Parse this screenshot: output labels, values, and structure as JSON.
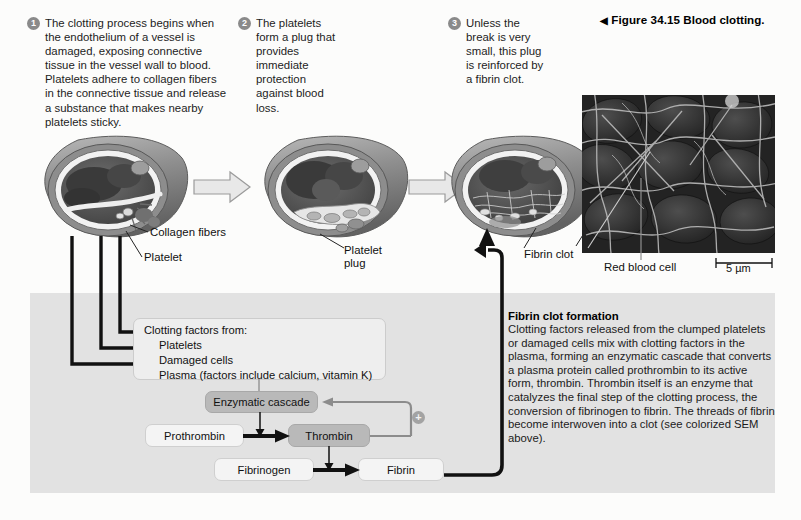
{
  "figure": {
    "caption_marker": "◀",
    "caption_number": "Figure 34.15",
    "caption_title": "Blood clotting."
  },
  "steps": [
    {
      "number": "1",
      "text": "The clotting process begins when the endothelium of a vessel is damaged, exposing connective tissue in the vessel wall to blood. Platelets adhere to collagen fibers in the connective tissue and release a substance that makes nearby platelets sticky."
    },
    {
      "number": "2",
      "text": "The platelets form a plug that provides immediate protection against blood loss."
    },
    {
      "number": "3",
      "text": "Unless the break is very small, this plug is reinforced by a fibrin clot."
    }
  ],
  "vessel_labels": {
    "collagen_fibers": "Collagen fibers",
    "platelet": "Platelet",
    "platelet_plug_line1": "Platelet",
    "platelet_plug_line2": "plug",
    "fibrin_clot": "Fibrin clot"
  },
  "micrograph": {
    "red_blood_cell_label": "Red blood cell",
    "scale_bar_label": "5 µm"
  },
  "clotting_factors": {
    "title": "Clotting factors from:",
    "items": [
      "Platelets",
      "Damaged cells",
      "Plasma (factors include calcium, vitamin K)"
    ]
  },
  "flowchart": {
    "enzymatic_cascade": "Enzymatic cascade",
    "prothrombin": "Prothrombin",
    "thrombin": "Thrombin",
    "fibrinogen": "Fibrinogen",
    "fibrin": "Fibrin",
    "feedback_symbol": "+"
  },
  "explanation": {
    "title": "Fibrin clot formation",
    "body": "Clotting factors released from the clumped platelets or damaged cells mix with clotting factors in the plasma, forming an enzymatic cascade that converts a plasma protein called prothrombin to its active form, thrombin. Thrombin itself is an enzyme that catalyzes the final step of the clotting process, the conversion of fibrinogen to fibrin. The threads of fibrin become interwoven into a clot (see colorized SEM above)."
  },
  "colors": {
    "panel_gray": "#e2e2e2",
    "box_dark": "#b9b9b9",
    "box_light": "#f4f4f4",
    "badge_gray": "#8a8a8a",
    "vessel_wall": "#9a9a9a",
    "vessel_interior": "#545454"
  }
}
